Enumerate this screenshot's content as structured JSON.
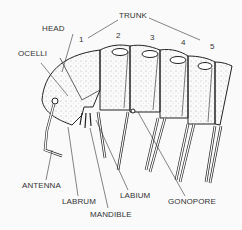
{
  "diagram": {
    "labels": {
      "trunk": "TRUNK",
      "head": "HEAD",
      "ocelli": "OCELLI",
      "antenna": "ANTENNA",
      "labrum": "LABRUM",
      "mandible": "MANDIBLE",
      "labium": "LABIUM",
      "gonopore": "GONOPORE"
    },
    "segment_numbers": [
      "1",
      "2",
      "3",
      "4",
      "5"
    ],
    "colors": {
      "ink": "#222222",
      "label": "#333333",
      "background": "#fafafa"
    }
  }
}
